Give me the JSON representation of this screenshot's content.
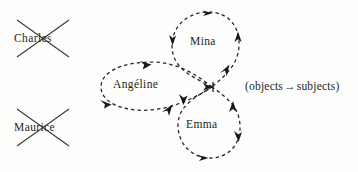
{
  "diagram": {
    "title": "",
    "background_color": "#fdfdfc",
    "ink_color": "#231f20",
    "crossed_out_nodes": [
      {
        "id": "charles",
        "label": "Charles",
        "x": 14,
        "y": 32,
        "cross_x": 16,
        "cross_y": 19,
        "cross_w": 54,
        "cross_h": 38
      },
      {
        "id": "maurice",
        "label": "Maurice",
        "x": 14,
        "y": 121,
        "cross_x": 16,
        "cross_y": 108,
        "cross_w": 54,
        "cross_h": 38
      }
    ],
    "loop_nodes": [
      {
        "id": "mina",
        "label": "Mina",
        "x": 190,
        "y": 35
      },
      {
        "id": "angeline",
        "label": "Angéline",
        "x": 113,
        "y": 78
      },
      {
        "id": "emma",
        "label": "Emma",
        "x": 186,
        "y": 118
      }
    ],
    "legend": {
      "open_paren": "(",
      "objects": "objects",
      "arrow_glyph": "→",
      "subjects": "subjects",
      "close_paren": ")",
      "full_text": "(objects→subjects)",
      "x": 245,
      "y": 80
    },
    "hub": {
      "x": 212,
      "y": 87
    },
    "edges": [
      {
        "from": "hub",
        "to": "mina",
        "style": "dashed-loop",
        "direction": "clockwise"
      },
      {
        "from": "hub",
        "to": "angeline",
        "style": "dashed-loop",
        "direction": "counterclockwise"
      },
      {
        "from": "hub",
        "to": "emma",
        "style": "dashed-loop",
        "direction": "counterclockwise"
      }
    ],
    "arrowheads": [
      {
        "loop": "mina",
        "position": "top",
        "points": "right"
      },
      {
        "loop": "mina",
        "position": "left",
        "points": "down"
      },
      {
        "loop": "mina",
        "position": "right",
        "points": "up"
      },
      {
        "loop": "mina",
        "position": "hub-entry",
        "points": "up-right"
      },
      {
        "loop": "angeline",
        "position": "top",
        "points": "up-left"
      },
      {
        "loop": "angeline",
        "position": "bottom-left",
        "points": "left"
      },
      {
        "loop": "angeline",
        "position": "bottom",
        "points": "right"
      },
      {
        "loop": "emma",
        "position": "bottom",
        "points": "left"
      },
      {
        "loop": "emma",
        "position": "left",
        "points": "down"
      },
      {
        "loop": "emma",
        "position": "right",
        "points": "down"
      },
      {
        "loop": "hub",
        "position": "center",
        "points": "right"
      }
    ]
  }
}
